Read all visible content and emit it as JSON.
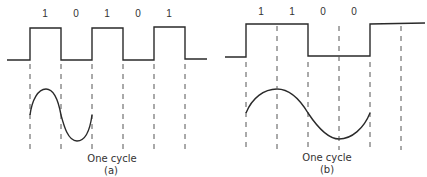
{
  "panels": [
    {
      "id": "a",
      "bits": [
        "1",
        "0",
        "1",
        "0",
        "1"
      ],
      "caption": "One cycle",
      "label": "(a)"
    },
    {
      "id": "b",
      "bits": [
        "1",
        "1",
        "0",
        "0"
      ],
      "caption": "One cycle",
      "label": "(b)"
    }
  ],
  "colors": {
    "line": "#2a2a2a",
    "dashed": "#555555",
    "text": "#333333",
    "background": "#ffffff"
  }
}
